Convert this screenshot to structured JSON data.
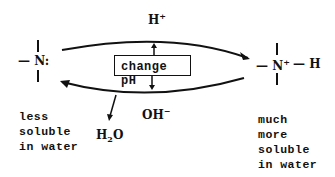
{
  "diagram": {
    "left_species": {
      "label": "— N:",
      "note": [
        "less",
        "soluble",
        "in water"
      ]
    },
    "right_species": {
      "label_n": "— N",
      "charge": "+",
      "label_h": "— H",
      "note": [
        "much",
        "more",
        "soluble",
        "in water"
      ]
    },
    "top_reagent": {
      "base": "H",
      "sup": "+"
    },
    "bottom_reagent": {
      "base": "OH",
      "sup": "−"
    },
    "byproduct": {
      "base": "H",
      "sub": "2",
      "rest": "O"
    },
    "center_box": "change pH"
  }
}
